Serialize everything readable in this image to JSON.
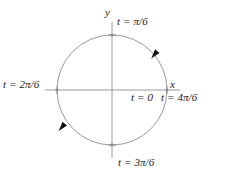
{
  "figure": {
    "kind": "parametric-circle-diagram",
    "axes": {
      "x_label": "x",
      "y_label": "y"
    },
    "colors": {
      "curve": "#9a9a9a",
      "axis": "#9a9a9a",
      "text": "#1a1a1a",
      "arrow": "#111111",
      "background": "#ffffff"
    },
    "geometry": {
      "center_x": 112,
      "center_y": 90,
      "radius": 55
    },
    "point_labels": {
      "top": "t = π/6",
      "left": "t = 2π/6",
      "bottom": "t = 3π/6",
      "right": "t = 4π/6",
      "origin_right": "t = 0"
    },
    "arrows": [
      {
        "name": "arrow-upper-right",
        "position_deg": 50,
        "direction": "clockwise"
      },
      {
        "name": "arrow-lower-left",
        "position_deg": 215,
        "direction": "clockwise"
      }
    ]
  }
}
